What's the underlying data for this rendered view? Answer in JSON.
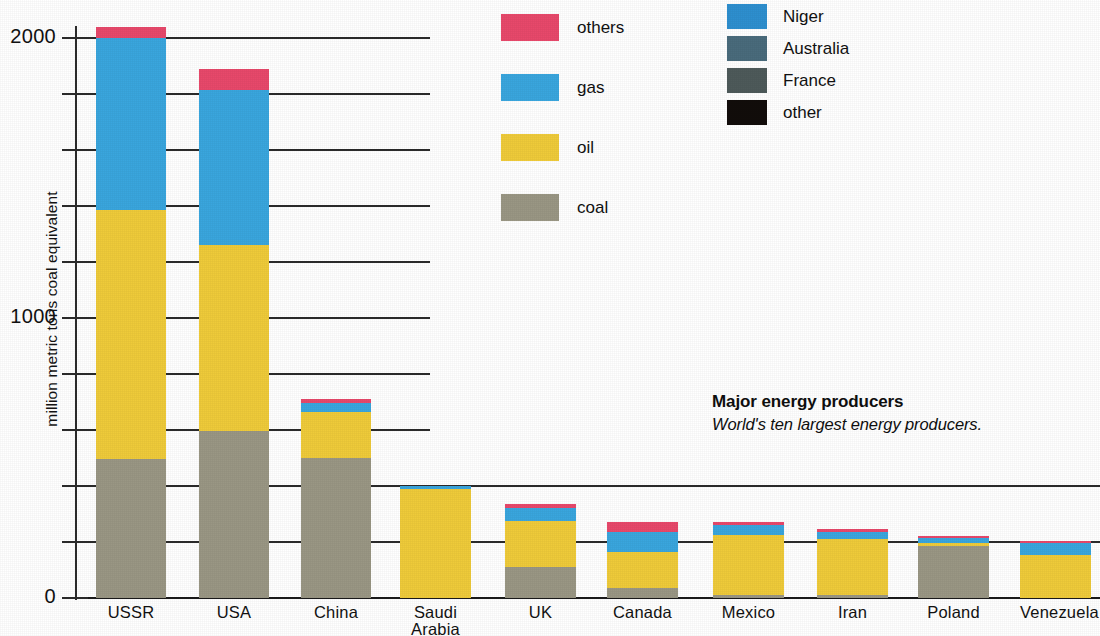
{
  "caption": {
    "title": "Major energy producers",
    "subtitle": "World's ten largest energy producers."
  },
  "axis": {
    "y_title": "million metric tons coal equivalent",
    "y_ticks_labeled": [
      "2000",
      "1000",
      "0"
    ]
  },
  "legend_left": {
    "items": [
      {
        "label": "others",
        "color": "#E8496B",
        "icon": "color-swatch"
      },
      {
        "label": "gas",
        "color": "#3AA6DE",
        "icon": "color-swatch"
      },
      {
        "label": "oil",
        "color": "#EFCB3A",
        "icon": "color-swatch"
      },
      {
        "label": "coal",
        "color": "#9A9784",
        "icon": "color-swatch"
      }
    ]
  },
  "legend_right": {
    "items": [
      {
        "label": "Niger",
        "color": "#2E8FCF",
        "icon": "color-swatch"
      },
      {
        "label": "Australia",
        "color": "#4A6B7C",
        "icon": "color-swatch"
      },
      {
        "label": "France",
        "color": "#4E5A5A",
        "icon": "color-swatch"
      },
      {
        "label": "other",
        "color": "#120D0B",
        "icon": "color-swatch"
      }
    ]
  },
  "chart_data": {
    "type": "bar",
    "subtype": "stacked",
    "title": "Major energy producers",
    "subtitle": "World's ten largest energy producers.",
    "xlabel": "",
    "ylabel": "million metric tons coal equivalent",
    "ylim": [
      0,
      2050
    ],
    "ytick_step": 200,
    "yticks": [
      0,
      200,
      400,
      600,
      800,
      1000,
      1200,
      1400,
      1600,
      1800,
      2000
    ],
    "ytick_labels_shown": [
      0,
      1000,
      2000
    ],
    "grid": true,
    "legend_position": "top",
    "categories": [
      "USSR",
      "USA",
      "China",
      "Saudi Arabia",
      "UK",
      "Canada",
      "Mexico",
      "Iran",
      "Poland",
      "Venezuela"
    ],
    "series": [
      {
        "name": "coal",
        "color": "#9A9784",
        "values": [
          495,
          595,
          500,
          0,
          110,
          35,
          10,
          10,
          185,
          0
        ]
      },
      {
        "name": "oil",
        "color": "#EFCB3A",
        "values": [
          890,
          665,
          165,
          390,
          165,
          130,
          215,
          200,
          10,
          155
        ]
      },
      {
        "name": "gas",
        "color": "#3AA6DE",
        "values": [
          615,
          555,
          30,
          10,
          45,
          70,
          35,
          25,
          20,
          40
        ]
      },
      {
        "name": "others",
        "color": "#E8496B",
        "values": [
          40,
          75,
          15,
          0,
          15,
          35,
          10,
          10,
          5,
          10
        ]
      }
    ],
    "totals": [
      2040,
      1890,
      710,
      400,
      335,
      270,
      270,
      245,
      220,
      205
    ]
  },
  "bars": [
    {
      "name": "USSR",
      "x": 96,
      "width": 70,
      "label_lines": [
        "USSR"
      ]
    },
    {
      "name": "USA",
      "x": 199,
      "width": 70,
      "label_lines": [
        "USA"
      ]
    },
    {
      "name": "China",
      "x": 301,
      "width": 70,
      "label_lines": [
        "China"
      ]
    },
    {
      "name": "Saudi Arabia",
      "x": 400,
      "width": 71,
      "label_lines": [
        "Saudi",
        "Arabia"
      ]
    },
    {
      "name": "UK",
      "x": 505,
      "width": 71,
      "label_lines": [
        "UK"
      ]
    },
    {
      "name": "Canada",
      "x": 607,
      "width": 71,
      "label_lines": [
        "Canada"
      ]
    },
    {
      "name": "Mexico",
      "x": 713,
      "width": 71,
      "label_lines": [
        "Mexico"
      ]
    },
    {
      "name": "Iran",
      "x": 817,
      "width": 71,
      "label_lines": [
        "Iran"
      ]
    },
    {
      "name": "Poland",
      "x": 918,
      "width": 71,
      "label_lines": [
        "Poland"
      ]
    },
    {
      "name": "Venezuela",
      "x": 1020,
      "width": 71,
      "label_lines": [
        "Venezuela"
      ]
    }
  ]
}
